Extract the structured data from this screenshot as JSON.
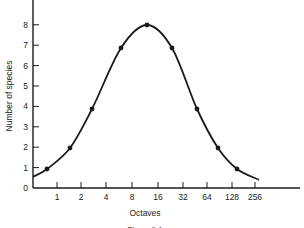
{
  "chart_data": {
    "type": "line",
    "title": "",
    "xlabel": "Octaves",
    "ylabel": "Number of species",
    "caption": "Figure 3.1",
    "x_tick_labels": [
      "1",
      "2",
      "4",
      "8",
      "16",
      "32",
      "64",
      "128",
      "256"
    ],
    "y_tick_labels": [
      "0",
      "1",
      "2",
      "3",
      "4",
      "5",
      "6",
      "7",
      "8"
    ],
    "ylim": [
      0,
      9
    ],
    "grid": false,
    "legend": null,
    "series": [
      {
        "name": "Species per octave",
        "style": "smooth curve with point markers",
        "x_octave_midpoints": [
          0.5,
          1.5,
          3,
          6,
          12,
          24,
          48,
          96,
          192
        ],
        "values": [
          1,
          2,
          4,
          7,
          8,
          7,
          4,
          2,
          1
        ]
      }
    ],
    "curve_extends": {
      "left_y_at_axis": 0.55,
      "right_end_y": 0.4
    }
  },
  "layout": {
    "plot": {
      "x0": 33,
      "y0": 188,
      "x_end": 300,
      "y_top": 0,
      "px_per_unit": 20.4
    },
    "x_tick_px": [
      57,
      81,
      106,
      132,
      158,
      183,
      207,
      232,
      255
    ],
    "point_px": [
      [
        47,
        169
      ],
      [
        70,
        148
      ],
      [
        92,
        109
      ],
      [
        121,
        48
      ],
      [
        147,
        25
      ],
      [
        172,
        48
      ],
      [
        197,
        109
      ],
      [
        218,
        148
      ],
      [
        237,
        169
      ]
    ],
    "colors": {
      "ink": "#1a1a1a",
      "background": "#ffffff"
    }
  }
}
